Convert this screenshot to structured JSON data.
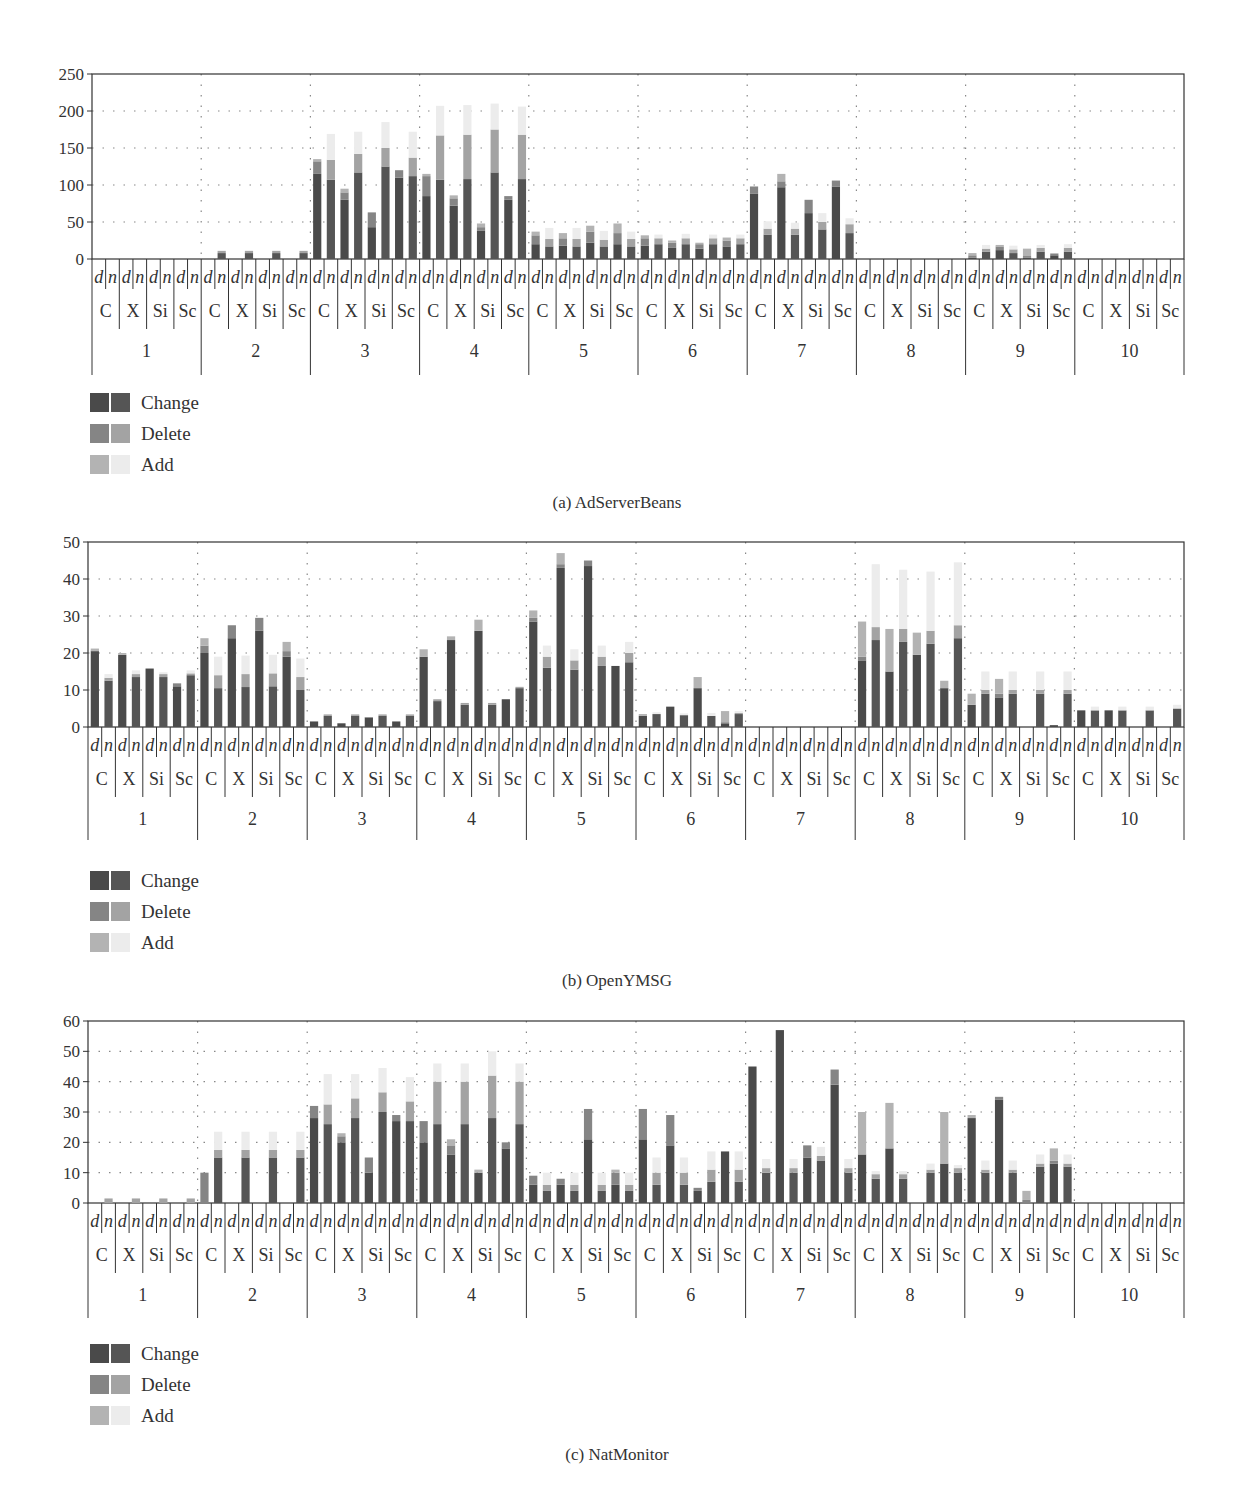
{
  "legend": {
    "items": [
      {
        "label": "Change",
        "colors": [
          "#4a4a4a",
          "#555555"
        ]
      },
      {
        "label": "Delete",
        "colors": [
          "#858585",
          "#a3a3a3"
        ]
      },
      {
        "label": "Add",
        "colors": [
          "#b3b3b3",
          "#ececec"
        ]
      }
    ]
  },
  "chart_data": [
    {
      "type": "bar",
      "stacked": true,
      "title": "(a) AdServerBeans",
      "xlabel": "",
      "ylabel": "",
      "ylim": [
        0,
        250
      ],
      "yticks": [
        0,
        50,
        100,
        150,
        200,
        250
      ],
      "grid": true,
      "legend_position": "bottom-left",
      "groups": [
        "1",
        "2",
        "3",
        "4",
        "5",
        "6",
        "7",
        "8",
        "9",
        "10"
      ],
      "subgroups": [
        "C",
        "X",
        "Si",
        "Sc"
      ],
      "bar_labels": [
        "d",
        "n"
      ],
      "series": [
        {
          "name": "Change",
          "values": [
            0,
            0,
            0,
            0,
            0,
            0,
            0,
            0,
            0,
            8,
            0,
            8,
            0,
            8,
            0,
            8,
            115,
            107,
            80,
            117,
            43,
            125,
            110,
            112,
            85,
            107,
            72,
            108,
            38,
            117,
            80,
            108,
            20,
            17,
            18,
            17,
            22,
            17,
            20,
            17,
            18,
            20,
            15,
            20,
            14,
            20,
            17,
            20,
            88,
            33,
            97,
            33,
            62,
            40,
            98,
            35,
            0,
            0,
            0,
            0,
            0,
            0,
            0,
            0,
            2,
            10,
            12,
            8,
            2,
            10,
            5,
            10,
            0,
            0,
            0,
            0,
            0,
            0,
            0,
            0
          ]
        },
        {
          "name": "Delete",
          "values": [
            0,
            0,
            0,
            0,
            0,
            0,
            0,
            0,
            0,
            3,
            0,
            3,
            0,
            3,
            0,
            3,
            17,
            27,
            10,
            25,
            20,
            25,
            10,
            25,
            27,
            60,
            10,
            60,
            5,
            58,
            5,
            60,
            12,
            10,
            10,
            10,
            15,
            9,
            15,
            10,
            10,
            8,
            7,
            8,
            6,
            8,
            8,
            8,
            10,
            8,
            8,
            8,
            18,
            10,
            8,
            12,
            0,
            0,
            0,
            0,
            0,
            0,
            0,
            0,
            3,
            4,
            5,
            5,
            2,
            5,
            2,
            5,
            0,
            0,
            0,
            0,
            0,
            0,
            0,
            0
          ]
        },
        {
          "name": "Add",
          "values": [
            0,
            0,
            0,
            0,
            0,
            0,
            0,
            0,
            0,
            0,
            0,
            0,
            0,
            0,
            0,
            0,
            3,
            35,
            5,
            30,
            0,
            35,
            0,
            35,
            3,
            40,
            4,
            40,
            5,
            35,
            0,
            38,
            5,
            15,
            7,
            15,
            8,
            12,
            13,
            10,
            4,
            5,
            3,
            6,
            2,
            5,
            4,
            5,
            0,
            10,
            10,
            8,
            0,
            12,
            0,
            8,
            0,
            0,
            0,
            0,
            0,
            0,
            0,
            0,
            3,
            5,
            2,
            5,
            10,
            4,
            1,
            5,
            0,
            0,
            0,
            0,
            0,
            0,
            0,
            0
          ]
        }
      ]
    },
    {
      "type": "bar",
      "stacked": true,
      "title": "(b) OpenYMSG",
      "xlabel": "",
      "ylabel": "",
      "ylim": [
        0,
        50
      ],
      "yticks": [
        0,
        10,
        20,
        30,
        40,
        50
      ],
      "grid": true,
      "legend_position": "bottom-left",
      "groups": [
        "1",
        "2",
        "3",
        "4",
        "5",
        "6",
        "7",
        "8",
        "9",
        "10"
      ],
      "subgroups": [
        "C",
        "X",
        "Si",
        "Sc"
      ],
      "bar_labels": [
        "d",
        "n"
      ],
      "series": [
        {
          "name": "Change",
          "values": [
            20.5,
            12.5,
            19.5,
            13.5,
            15.8,
            13.5,
            11,
            14,
            20,
            10.5,
            24,
            10.8,
            26,
            11,
            19,
            10,
            1.5,
            3,
            1,
            3,
            2.5,
            3,
            1.5,
            3,
            19,
            7,
            23.5,
            6,
            26,
            6,
            7.5,
            10.5,
            28.5,
            16,
            43,
            15.5,
            43.5,
            16.5,
            16.5,
            17.5,
            3,
            3.5,
            5.5,
            3.2,
            10.5,
            3,
            1,
            3.5,
            0,
            0,
            0,
            0,
            0,
            0,
            0,
            0,
            18,
            23.5,
            15,
            23,
            19.5,
            22.5,
            10.5,
            24,
            6,
            9,
            8,
            9,
            0,
            9,
            0.5,
            9,
            4.5,
            4.5,
            4.5,
            4.5,
            0,
            4.5,
            0,
            5
          ]
        },
        {
          "name": "Delete",
          "values": [
            0.2,
            0.8,
            0,
            0.8,
            0,
            0.8,
            0.8,
            0.5,
            2,
            3.5,
            3.5,
            3.5,
            3.5,
            3.5,
            1.5,
            3.5,
            0,
            0.4,
            0,
            0.4,
            0.2,
            0.4,
            0,
            0.4,
            0,
            0.5,
            0,
            0.5,
            0,
            0.5,
            0,
            0.3,
            1,
            3,
            1,
            2.5,
            1.5,
            2.5,
            0,
            2.5,
            0,
            0,
            0,
            0,
            0,
            0,
            0.3,
            0.3,
            0,
            0,
            0,
            0,
            0,
            0,
            0,
            0,
            1,
            3.5,
            0,
            3.5,
            0,
            3.5,
            0,
            3.5,
            0,
            1,
            1,
            1,
            0,
            1,
            0,
            1,
            0,
            0,
            0,
            0,
            0,
            0,
            0,
            0
          ]
        },
        {
          "name": "Add",
          "values": [
            0.5,
            1,
            0.5,
            1,
            0,
            0.5,
            0,
            0.8,
            2,
            5,
            0,
            5,
            0,
            5,
            2.5,
            5,
            0,
            0,
            0,
            0,
            0,
            0,
            0,
            0,
            2,
            0,
            1,
            0,
            3,
            0,
            0,
            0.2,
            2,
            3,
            3,
            3,
            0,
            3,
            0,
            3,
            0.5,
            0.5,
            0,
            0.5,
            3,
            0.8,
            3,
            0.5,
            0,
            0,
            0,
            0,
            0,
            0,
            0,
            0,
            9.5,
            17,
            11.5,
            16,
            6,
            16,
            2,
            17,
            3,
            5,
            4,
            5,
            0,
            5,
            0,
            5,
            0,
            1,
            0,
            1,
            0,
            1,
            0,
            1
          ]
        }
      ]
    },
    {
      "type": "bar",
      "stacked": true,
      "title": "(c) NatMonitor",
      "xlabel": "",
      "ylabel": "",
      "ylim": [
        0,
        60
      ],
      "yticks": [
        0,
        10,
        20,
        30,
        40,
        50,
        60
      ],
      "grid": true,
      "legend_position": "bottom-left",
      "groups": [
        "1",
        "2",
        "3",
        "4",
        "5",
        "6",
        "7",
        "8",
        "9",
        "10"
      ],
      "subgroups": [
        "C",
        "X",
        "Si",
        "Sc"
      ],
      "bar_labels": [
        "d",
        "n"
      ],
      "series": [
        {
          "name": "Change",
          "values": [
            0,
            0,
            0,
            0,
            0,
            0,
            0,
            0,
            0,
            15,
            0,
            15,
            0,
            15,
            0,
            15,
            28,
            26,
            20,
            28,
            10,
            30,
            27,
            27,
            20,
            26,
            16,
            26,
            10,
            28,
            18,
            26,
            6,
            4,
            6,
            4,
            21,
            4,
            6,
            4,
            21,
            6,
            19,
            6,
            4,
            7,
            17,
            7,
            45,
            10,
            57,
            10,
            15,
            14,
            39,
            10,
            16,
            8,
            18,
            8,
            0,
            10,
            13,
            10,
            28,
            10,
            34,
            10,
            0,
            12,
            13,
            12,
            0,
            0,
            0,
            0,
            0,
            0,
            0,
            0
          ]
        },
        {
          "name": "Delete",
          "values": [
            0,
            1.5,
            0,
            1.5,
            0,
            1.5,
            0,
            1.5,
            10,
            2.5,
            0,
            2.5,
            0,
            2.5,
            0,
            2.5,
            4,
            6.5,
            2,
            6.5,
            5,
            6.5,
            2,
            6.5,
            7,
            14,
            3,
            14,
            0,
            14,
            2,
            14,
            3,
            2,
            2,
            2,
            10,
            2,
            4,
            2,
            10,
            4,
            10,
            4,
            1,
            4,
            0,
            4,
            0,
            1.5,
            0,
            1.5,
            4,
            1.5,
            5,
            1.5,
            0,
            1.5,
            0,
            1.5,
            0,
            1,
            0,
            1.5,
            0,
            1,
            1,
            1,
            1,
            1,
            1,
            1,
            0,
            0,
            0,
            0,
            0,
            0,
            0,
            0
          ]
        },
        {
          "name": "Add",
          "values": [
            0,
            0,
            0,
            0,
            0,
            0,
            0,
            0,
            0,
            6,
            0,
            6,
            0,
            6,
            0,
            6,
            0,
            10,
            1,
            8,
            0,
            8,
            0,
            8,
            0,
            6,
            2,
            6,
            1,
            8,
            0,
            6,
            0,
            4,
            0,
            4,
            0,
            4,
            1,
            4,
            0,
            5,
            0,
            5,
            0,
            6,
            0,
            6,
            0,
            3,
            0,
            3,
            0,
            3,
            0,
            3,
            14,
            1,
            15,
            1,
            0,
            2,
            17,
            1,
            1,
            3,
            0,
            3,
            3,
            3,
            4,
            3,
            0,
            0,
            0,
            0,
            0,
            0,
            0,
            0
          ]
        }
      ]
    }
  ]
}
